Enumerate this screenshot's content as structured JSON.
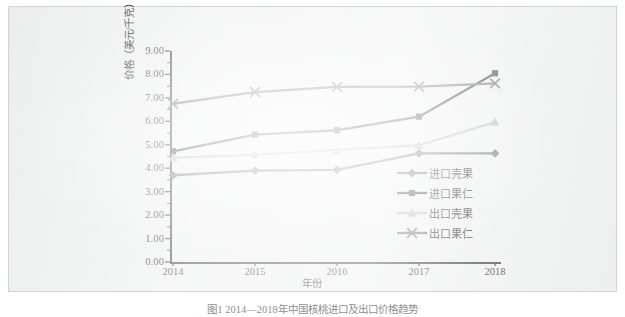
{
  "figure": {
    "caption": "图1 2014—2018年中国核桃进口及出口价格趋势",
    "background_color": "#eceded",
    "border_color": "#d2d4d4"
  },
  "chart_data": {
    "type": "line",
    "title": "",
    "subtitle": "",
    "xlabel": "年份",
    "ylabel": "价格（美元/千克）",
    "categories": [
      "2014",
      "2015",
      "2016",
      "2017",
      "2018"
    ],
    "x": [
      2014,
      2015,
      2016,
      2017,
      2018
    ],
    "ylim": [
      0.0,
      9.0
    ],
    "ytick_labels": [
      "9.00",
      "8.00",
      "7.00",
      "6.00",
      "5.00",
      "4.00",
      "3.00",
      "2.00",
      "1.00",
      "0.00"
    ],
    "ytick_values": [
      9.0,
      8.0,
      7.0,
      6.0,
      5.0,
      4.0,
      3.0,
      2.0,
      1.0,
      0.0
    ],
    "xtick_labels": [
      "2014",
      "2015",
      "2016",
      "2017",
      "2018"
    ],
    "grid": false,
    "legend_position": "inside-lower-right",
    "series": [
      {
        "name": "进口壳果",
        "marker": "diamond",
        "color": "#6c6c6c",
        "values": [
          3.7,
          3.9,
          3.93,
          4.63,
          4.63
        ]
      },
      {
        "name": "进口果仁",
        "marker": "square",
        "color": "#3b3b3b",
        "values": [
          4.72,
          5.43,
          5.62,
          6.2,
          8.05
        ]
      },
      {
        "name": "出口壳果",
        "marker": "triangle",
        "color": "#b9b9b9",
        "values": [
          4.45,
          4.57,
          4.78,
          4.98,
          5.97
        ]
      },
      {
        "name": "出口果仁",
        "marker": "x",
        "color": "#6f6f6f",
        "values": [
          6.75,
          7.25,
          7.47,
          7.48,
          7.62
        ]
      }
    ]
  },
  "axis": {
    "y_title": "价格（美元/千克）",
    "x_title": "年份"
  },
  "legend": {
    "items": [
      {
        "label": "进口壳果",
        "marker": "diamond",
        "color": "#6c6c6c"
      },
      {
        "label": "进口果仁",
        "marker": "square",
        "color": "#3b3b3b"
      },
      {
        "label": "出口壳果",
        "marker": "triangle",
        "color": "#b9b9b9"
      },
      {
        "label": "出口果仁",
        "marker": "x",
        "color": "#6f6f6f"
      }
    ]
  }
}
